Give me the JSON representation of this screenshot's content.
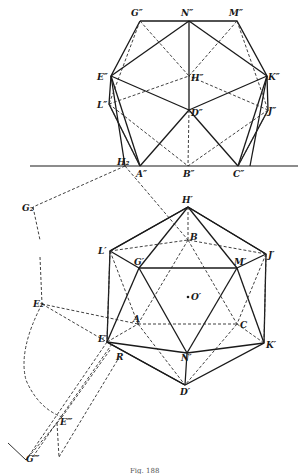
{
  "figure": {
    "caption": "Fig. 188",
    "ground_line_y": 166
  },
  "front_view": {
    "label_suffix": "″",
    "points": {
      "G": {
        "label": "G″",
        "x": 140,
        "y": 21
      },
      "N": {
        "label": "N″",
        "x": 189,
        "y": 21
      },
      "M": {
        "label": "M″",
        "x": 237,
        "y": 21
      },
      "E": {
        "label": "E″",
        "x": 111,
        "y": 76
      },
      "H": {
        "label": "H″",
        "x": 189,
        "y": 76
      },
      "K": {
        "label": "K″",
        "x": 267,
        "y": 76
      },
      "L": {
        "label": "L″",
        "x": 109,
        "y": 104
      },
      "D": {
        "label": "D″",
        "x": 189,
        "y": 110
      },
      "J": {
        "label": "J″",
        "x": 268,
        "y": 110
      },
      "A": {
        "label": "A″",
        "x": 140,
        "y": 166
      },
      "B": {
        "label": "B″",
        "x": 188,
        "y": 166
      },
      "C": {
        "label": "C″",
        "x": 238,
        "y": 166
      }
    }
  },
  "top_view": {
    "points": {
      "H": {
        "label": "H′",
        "x": 188,
        "y": 207
      },
      "B": {
        "label": "B",
        "x": 188,
        "y": 240
      },
      "L": {
        "label": "L′",
        "x": 110,
        "y": 251
      },
      "J": {
        "label": "J′",
        "x": 266,
        "y": 254
      },
      "G": {
        "label": "G′",
        "x": 139,
        "y": 268
      },
      "M": {
        "label": "M′",
        "x": 237,
        "y": 268
      },
      "O": {
        "label": "O′",
        "x": 190,
        "y": 297
      },
      "A": {
        "label": "A",
        "x": 138,
        "y": 324
      },
      "C": {
        "label": "C",
        "x": 237,
        "y": 324
      },
      "E": {
        "label": "E′",
        "x": 107,
        "y": 342
      },
      "K": {
        "label": "K′",
        "x": 264,
        "y": 343
      },
      "N": {
        "label": "N′",
        "x": 187,
        "y": 353
      },
      "D": {
        "label": "D′",
        "x": 185,
        "y": 385
      },
      "R": {
        "label": "R",
        "x": 120,
        "y": 356
      }
    }
  },
  "construction": {
    "points": {
      "H2": {
        "label": "H₂",
        "x": 125,
        "y": 166
      },
      "G2": {
        "label": "G₂",
        "x": 33,
        "y": 207
      },
      "E2": {
        "label": "E₂",
        "x": 42,
        "y": 304
      },
      "E3": {
        "label": "E‴",
        "x": 62,
        "y": 417
      },
      "G3": {
        "label": "G‴",
        "x": 26,
        "y": 460
      }
    }
  },
  "colors": {
    "ink": "#1a1a1a",
    "paper": "#ffffff"
  }
}
